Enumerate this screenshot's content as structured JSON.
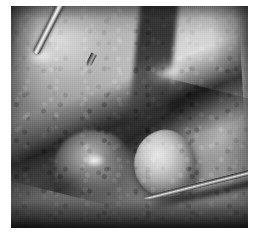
{
  "page": {
    "kind": "photograph",
    "width": 254,
    "height": 247,
    "background_color": "#ffffff",
    "caption": ""
  },
  "photo": {
    "name": "intraoperative-surgical-photograph",
    "modality": "grayscale-clinical-photo",
    "description": "Black-and-white intraoperative close-up of an open surgical field showing exposed soft tissue with a deep diagonal dissection cleft, a pale rounded nodule in the lower centre-right, and two metallic surgical instruments.",
    "frame": {
      "left": 11,
      "top": 6,
      "width": 237,
      "height": 222
    },
    "tonality": {
      "highlight": "#e9e9e9",
      "midtone": "#9a9a9a",
      "shadow": "#3a3a3a",
      "deep_shadow": "#141414",
      "border": "#ffffff"
    },
    "regions": [
      {
        "name": "upper-left-tissue-flap",
        "tone": "light-grey"
      },
      {
        "name": "upper-right-tissue-sheet",
        "tone": "bright-grey"
      },
      {
        "name": "central-dissection-cleft",
        "tone": "dark"
      },
      {
        "name": "upper-central-fissure",
        "tone": "very-dark"
      },
      {
        "name": "lower-left-tissue-lobe",
        "tone": "mid-grey"
      },
      {
        "name": "pale-rounded-nodule",
        "tone": "bright"
      },
      {
        "name": "bottom-shadow-band",
        "tone": "near-black"
      },
      {
        "name": "left-margin-shadow",
        "tone": "dark"
      },
      {
        "name": "right-margin-shadow",
        "tone": "dark"
      }
    ],
    "instruments": [
      {
        "name": "upper-surgical-probe",
        "type": "metal-shaft-probe",
        "entry": "top",
        "direction": "downward-right",
        "tone": "specular-metal"
      },
      {
        "name": "lower-surgical-needle-probe",
        "type": "fine-pointed-probe",
        "entry": "right",
        "direction": "leftward-up",
        "tone": "dark-metal",
        "points_at": "pale-rounded-nodule"
      }
    ]
  }
}
